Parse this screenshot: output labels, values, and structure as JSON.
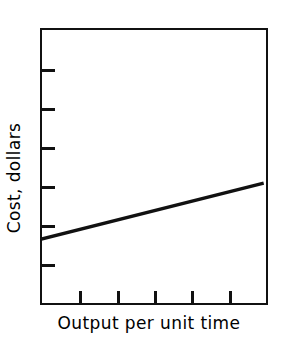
{
  "chart_data": {
    "type": "line",
    "title": "",
    "subtitle": "",
    "xlabel": "Output per unit time",
    "ylabel": "Cost, dollars",
    "grid": false,
    "legend": null,
    "legend_position": "none",
    "annotations": [],
    "axes": {
      "x": {
        "label": "Output per unit time",
        "tick_labels": [],
        "tick_count": 5,
        "tick_fractions": [
          0.1667,
          0.3333,
          0.5,
          0.6667,
          0.8333
        ],
        "xlim": [
          0,
          1
        ],
        "ticks_inward": true
      },
      "y": {
        "label": "Cost, dollars",
        "tick_labels": [],
        "tick_count": 6,
        "tick_fractions": [
          0.1429,
          0.2857,
          0.4286,
          0.5714,
          0.7143,
          0.8571
        ],
        "ylim": [
          0,
          1
        ],
        "ticks_inward": true
      }
    },
    "series": [
      {
        "name": "total cost",
        "shape": "straight-line",
        "x": [
          0,
          1
        ],
        "y": [
          0.2238,
          0.4296
        ],
        "color": "#111111",
        "line_width": 3
      }
    ]
  },
  "figure": {
    "frame_color": "#111111",
    "background_color": "#ffffff",
    "ink_color": "#111111"
  },
  "labels": {
    "x_axis": "Output per unit time",
    "y_axis": "Cost, dollars"
  }
}
